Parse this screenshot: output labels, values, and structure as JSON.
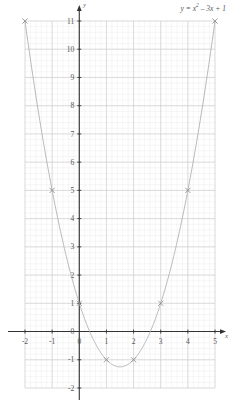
{
  "chart_data": {
    "type": "line",
    "title": "",
    "equation_label": "y = x² – 3x + 1",
    "equation_parts": {
      "lhs": "y",
      "eq": " = ",
      "base": "x",
      "exp": "2",
      "rest": " – 3x + 1"
    },
    "xlabel": "x",
    "ylabel": "y",
    "xlim": [
      -2,
      5
    ],
    "ylim": [
      -2,
      11
    ],
    "xticks": [
      -2,
      -1,
      0,
      1,
      2,
      3,
      4,
      5
    ],
    "yticks": [
      -2,
      -1,
      0,
      1,
      2,
      3,
      4,
      5,
      6,
      7,
      8,
      9,
      10,
      11
    ],
    "xticklabels": [
      "-2",
      "-1",
      "0",
      "1",
      "2",
      "3",
      "4",
      "5"
    ],
    "yticklabels": [
      "-2",
      "-1",
      "0",
      "1",
      "2",
      "3",
      "4",
      "5",
      "6",
      "7",
      "8",
      "9",
      "10",
      "11"
    ],
    "grid": true,
    "grid_major_step": 1,
    "grid_minor_step": 0.2,
    "legend": null,
    "marker": "x",
    "x": [
      -2,
      -1,
      0,
      1,
      2,
      3,
      4,
      5
    ],
    "values": [
      11,
      5,
      1,
      -1,
      -1,
      1,
      5,
      11
    ],
    "points": [
      {
        "x": -2,
        "y": 11
      },
      {
        "x": -1,
        "y": 5
      },
      {
        "x": 0,
        "y": 1
      },
      {
        "x": 1,
        "y": -1
      },
      {
        "x": 2,
        "y": -1
      },
      {
        "x": 3,
        "y": 1
      },
      {
        "x": 4,
        "y": 5
      },
      {
        "x": 5,
        "y": 11
      }
    ],
    "vertex": {
      "x": 1.5,
      "y": -1.25
    },
    "curve_color": "#b0b0b0",
    "axis_color": "#333333",
    "grid_major_color": "#c9c9c9",
    "grid_minor_color": "#e9e9e9",
    "marker_color": "#888888",
    "text_color": "#555555"
  }
}
